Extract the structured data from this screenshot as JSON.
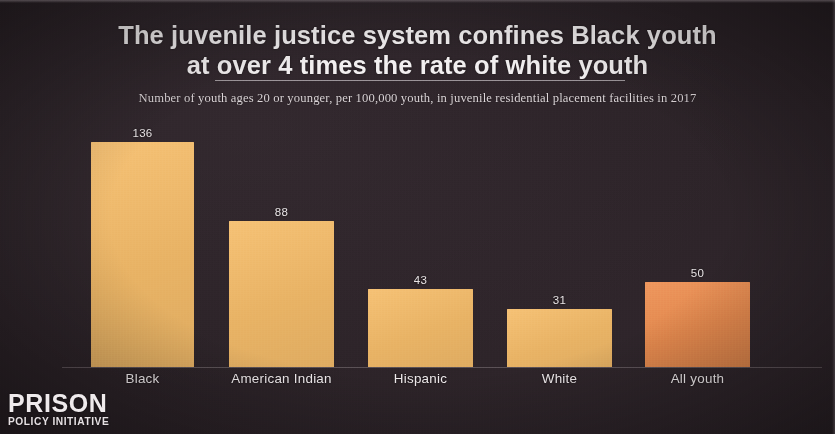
{
  "theme": {
    "background_color": "#2b2227",
    "text_color": "#f2eff0",
    "bar_color": "#f5bd6b",
    "highlight_bar_color": "#ed8f51",
    "rule_color": "#e1dcde"
  },
  "header": {
    "title_line1": "The juvenile justice system confines Black youth",
    "title_line2": "at over 4 times the rate of white youth",
    "subtitle": "Number of youth ages 20 or younger, per 100,000 youth, in juvenile residential placement facilities in 2017"
  },
  "logo": {
    "primary": "PRISON",
    "secondary": "POLICY INITIATIVE"
  },
  "chart_data": {
    "type": "bar",
    "title": "The juvenile justice system confines Black youth at over 4 times the rate of white youth",
    "subtitle": "Number of youth ages 20 or younger, per 100,000 youth, in juvenile residential placement facilities in 2017",
    "xlabel": "",
    "ylabel": "Number of youth per 100,000 youth",
    "ylim": [
      0,
      136
    ],
    "grid": false,
    "legend": "none",
    "categories": [
      "Black",
      "American Indian",
      "Hispanic",
      "White",
      "All youth"
    ],
    "values": [
      136,
      88,
      43,
      31,
      50
    ],
    "value_labels": [
      "136",
      "88",
      "43",
      "31",
      "50"
    ],
    "bar_colors": [
      "#f5bd6b",
      "#f5bd6b",
      "#f5bd6b",
      "#f5bd6b",
      "#ed8f51"
    ],
    "bars": [
      {
        "label": "Black",
        "value": 136,
        "value_label": "136",
        "color": "#f5bd6b",
        "x": 91,
        "width": 103,
        "top": 142,
        "height": 225
      },
      {
        "label": "American Indian",
        "value": 88,
        "value_label": "88",
        "color": "#f5bd6b",
        "x": 229,
        "width": 105,
        "top": 221,
        "height": 146
      },
      {
        "label": "Hispanic",
        "value": 43,
        "value_label": "43",
        "color": "#f5bd6b",
        "x": 368,
        "width": 105,
        "top": 289,
        "height": 78
      },
      {
        "label": "White",
        "value": 31,
        "value_label": "31",
        "color": "#f5bd6b",
        "x": 507,
        "width": 105,
        "top": 309,
        "height": 58
      },
      {
        "label": "All youth",
        "value": 50,
        "value_label": "50",
        "color": "#ed8f51",
        "x": 645,
        "width": 105,
        "top": 282,
        "height": 85
      }
    ]
  }
}
